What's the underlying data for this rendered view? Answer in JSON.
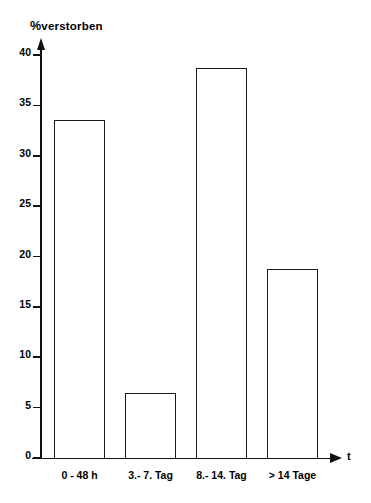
{
  "chart_data": {
    "type": "bar",
    "title": "",
    "subtitle": "",
    "ylabel": "% verstorben",
    "ylabel_parts": {
      "percent_symbol": "%",
      "word": "verstorben"
    },
    "xlabel": "t",
    "categories": [
      "0 - 48 h",
      "3.- 7. Tag",
      "8.- 14. Tag",
      "> 14 Tage"
    ],
    "values": [
      33.5,
      6.5,
      38.7,
      18.8
    ],
    "ylim": [
      0,
      40
    ],
    "ytick_labels": [
      "0",
      "5",
      "10",
      "15",
      "20",
      "25",
      "30",
      "35",
      "40"
    ],
    "ytick_values": [
      0,
      5,
      10,
      15,
      20,
      25,
      30,
      35,
      40
    ],
    "grid": false,
    "legend": null,
    "legend_position": "none",
    "series": [
      {
        "name": "% verstorben",
        "values": [
          33.5,
          6.5,
          38.7,
          18.8
        ]
      }
    ],
    "bar_style": {
      "fill_color": "#ffffff",
      "edge_color": "#1a1a1a",
      "axis_color": "#111111"
    }
  }
}
